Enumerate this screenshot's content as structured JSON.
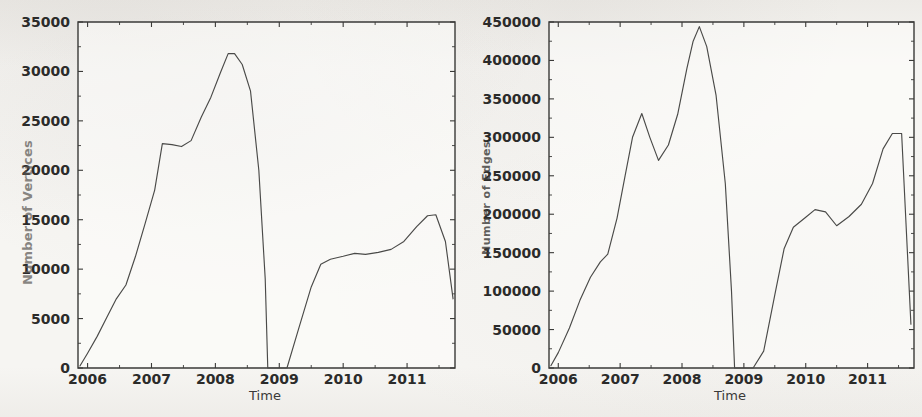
{
  "page": {
    "background_color": "#f6f5f2",
    "line_color": "#4a4a48",
    "axis_color": "#3a3a38",
    "text_color": "#2b2b2a"
  },
  "figures": [
    {
      "id": "vertices",
      "ylabel": "Number of Vertices",
      "xlabel": "Time",
      "yticks": [
        "0",
        "5000",
        "10000",
        "15000",
        "20000",
        "25000",
        "30000",
        "35000"
      ],
      "xticks": [
        "2006",
        "2007",
        "2008",
        "2009",
        "2010",
        "2011"
      ]
    },
    {
      "id": "edges",
      "ylabel": "Number of Edges",
      "xlabel": "Time",
      "yticks": [
        "0",
        "50000",
        "100000",
        "150000",
        "200000",
        "250000",
        "300000",
        "350000",
        "400000",
        "450000"
      ],
      "xticks": [
        "2006",
        "2007",
        "2008",
        "2009",
        "2010",
        "2011"
      ]
    }
  ],
  "chart_data": [
    {
      "type": "line",
      "id": "vertices",
      "title": "",
      "xlabel": "Time",
      "ylabel": "Number of Vertices",
      "xlim": [
        2005.85,
        2011.75
      ],
      "ylim": [
        0,
        35000
      ],
      "ytick_values": [
        0,
        5000,
        10000,
        15000,
        20000,
        25000,
        30000,
        35000
      ],
      "xtick_values": [
        2006,
        2007,
        2008,
        2009,
        2010,
        2011
      ],
      "grid": false,
      "legend": null,
      "series": [
        {
          "name": "Number of Vertices",
          "x": [
            2005.88,
            2006.0,
            2006.15,
            2006.3,
            2006.45,
            2006.6,
            2006.75,
            2006.9,
            2007.05,
            2007.17,
            2007.32,
            2007.47,
            2007.62,
            2007.78,
            2007.93,
            2008.08,
            2008.2,
            2008.3,
            2008.42,
            2008.55,
            2008.68,
            2008.78,
            2008.82,
            2008.98,
            2009.12,
            2009.3,
            2009.5,
            2009.65,
            2009.8,
            2010.0,
            2010.18,
            2010.35,
            2010.55,
            2010.75,
            2010.95,
            2011.15,
            2011.32,
            2011.45,
            2011.6,
            2011.72
          ],
          "y": [
            200,
            1500,
            3200,
            5100,
            7000,
            8400,
            11300,
            14600,
            18000,
            22700,
            22600,
            22400,
            23000,
            25400,
            27400,
            29900,
            31800,
            31800,
            30700,
            28000,
            20000,
            9000,
            0,
            0,
            0,
            3900,
            8200,
            10500,
            11000,
            11300,
            11600,
            11500,
            11700,
            12000,
            12800,
            14300,
            15400,
            15500,
            12800,
            7000
          ]
        }
      ]
    },
    {
      "type": "line",
      "id": "edges",
      "title": "",
      "xlabel": "Time",
      "ylabel": "Number of Edges",
      "xlim": [
        2005.85,
        2011.75
      ],
      "ylim": [
        0,
        450000
      ],
      "ytick_values": [
        0,
        50000,
        100000,
        150000,
        200000,
        250000,
        300000,
        350000,
        400000,
        450000
      ],
      "xtick_values": [
        2006,
        2007,
        2008,
        2009,
        2010,
        2011
      ],
      "grid": false,
      "legend": null,
      "series": [
        {
          "name": "Number of Edges",
          "x": [
            2005.88,
            2006.0,
            2006.18,
            2006.35,
            2006.52,
            2006.68,
            2006.8,
            2006.95,
            2007.08,
            2007.2,
            2007.35,
            2007.48,
            2007.62,
            2007.78,
            2007.93,
            2008.08,
            2008.18,
            2008.28,
            2008.4,
            2008.55,
            2008.7,
            2008.8,
            2008.85,
            2009.0,
            2009.15,
            2009.32,
            2009.5,
            2009.65,
            2009.8,
            2010.0,
            2010.15,
            2010.32,
            2010.5,
            2010.7,
            2010.9,
            2011.08,
            2011.25,
            2011.4,
            2011.55,
            2011.7
          ],
          "y": [
            3000,
            20000,
            52000,
            88000,
            118000,
            138000,
            148000,
            195000,
            250000,
            300000,
            331000,
            300000,
            270000,
            290000,
            330000,
            390000,
            425000,
            444000,
            418000,
            355000,
            240000,
            100000,
            0,
            0,
            0,
            22000,
            95000,
            155000,
            183000,
            196000,
            206000,
            203000,
            185000,
            197000,
            213000,
            240000,
            285000,
            305000,
            305000,
            57000
          ]
        }
      ]
    }
  ]
}
